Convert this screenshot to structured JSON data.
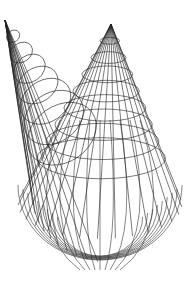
{
  "figure": {
    "stroke_color": "#222222",
    "background_color": "#ffffff",
    "left_apex": [
      5,
      20
    ],
    "right_apex": [
      111,
      24
    ],
    "base_bottom_y": 270
  }
}
